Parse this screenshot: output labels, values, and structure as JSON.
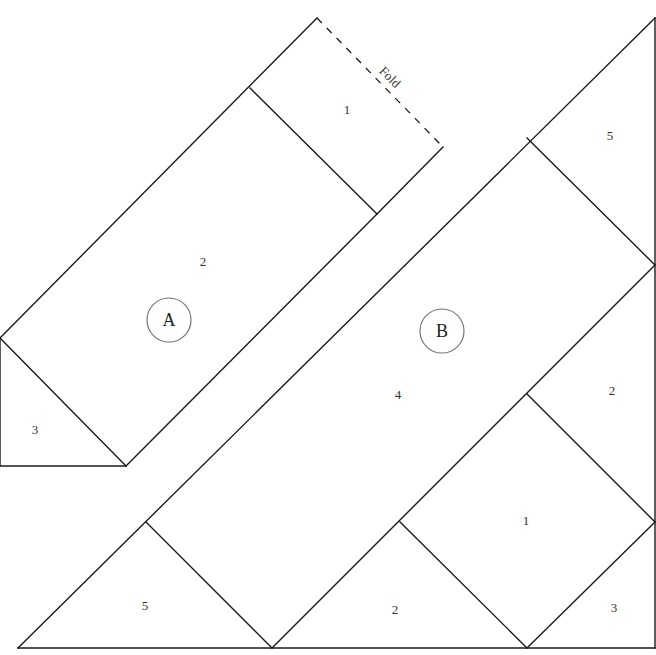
{
  "diagram": {
    "type": "quilt-foundation-paper-piecing-template",
    "fold_label": "Fold",
    "sections": [
      {
        "id": "A",
        "label": "A",
        "badge": {
          "cx": 169,
          "cy": 320,
          "r": 22
        },
        "pieces": [
          {
            "number": "1",
            "x": 347,
            "y": 111
          },
          {
            "number": "2",
            "x": 203,
            "y": 263
          },
          {
            "number": "3",
            "x": 35,
            "y": 431
          }
        ]
      },
      {
        "id": "B",
        "label": "B",
        "badge": {
          "cx": 442,
          "cy": 331,
          "r": 22
        },
        "pieces": [
          {
            "number": "5",
            "x": 610,
            "y": 137
          },
          {
            "number": "2",
            "x": 612,
            "y": 392
          },
          {
            "number": "4",
            "x": 398,
            "y": 396
          },
          {
            "number": "1",
            "x": 526,
            "y": 522
          },
          {
            "number": "5",
            "x": 145,
            "y": 607
          },
          {
            "number": "2",
            "x": 395,
            "y": 611
          },
          {
            "number": "3",
            "x": 614,
            "y": 609
          }
        ]
      }
    ],
    "lines": [
      {
        "name": "section-a-outline-top-left",
        "points": [
          [
            0,
            338
          ],
          [
            317,
            18
          ]
        ]
      },
      {
        "name": "section-a-outline-left",
        "points": [
          [
            0,
            338
          ],
          [
            0,
            466
          ]
        ]
      },
      {
        "name": "section-a-outline-bottom",
        "points": [
          [
            0,
            466
          ],
          [
            126,
            466
          ]
        ]
      },
      {
        "name": "section-a-outline-right",
        "points": [
          [
            126,
            466
          ],
          [
            377,
            214
          ]
        ]
      },
      {
        "name": "section-a-piece-1-2-seam",
        "points": [
          [
            250,
            88
          ],
          [
            377,
            214
          ]
        ]
      },
      {
        "name": "section-a-piece-2-3-seam",
        "points": [
          [
            0,
            338
          ],
          [
            126,
            466
          ]
        ]
      },
      {
        "name": "section-a-edge-to-fold",
        "points": [
          [
            377,
            214
          ],
          [
            443,
            147
          ]
        ]
      },
      {
        "name": "section-b-outline-diagonal",
        "points": [
          [
            18,
            648
          ],
          [
            655,
            18
          ]
        ]
      },
      {
        "name": "section-b-outline-right",
        "points": [
          [
            655,
            18
          ],
          [
            655,
            648
          ]
        ]
      },
      {
        "name": "section-b-outline-bottom",
        "points": [
          [
            18,
            648
          ],
          [
            655,
            648
          ]
        ]
      },
      {
        "name": "section-b-seam-5-top",
        "points": [
          [
            527,
            138
          ],
          [
            655,
            265
          ]
        ]
      },
      {
        "name": "section-b-seam-4-right",
        "points": [
          [
            272,
            648
          ],
          [
            655,
            265
          ]
        ]
      },
      {
        "name": "section-b-seam-5-bottom",
        "points": [
          [
            146,
            522
          ],
          [
            272,
            648
          ]
        ]
      },
      {
        "name": "section-b-seam-1-top",
        "points": [
          [
            527,
            394
          ],
          [
            655,
            522
          ]
        ]
      },
      {
        "name": "section-b-seam-2-left",
        "points": [
          [
            400,
            522
          ],
          [
            527,
            648
          ]
        ]
      },
      {
        "name": "section-b-seam-3",
        "points": [
          [
            527,
            648
          ],
          [
            655,
            522
          ]
        ]
      }
    ],
    "fold_line": {
      "points": [
        [
          317,
          18
        ],
        [
          443,
          147
        ]
      ],
      "label_pos": {
        "x": 389,
        "y": 78,
        "rotate": 45
      }
    }
  }
}
